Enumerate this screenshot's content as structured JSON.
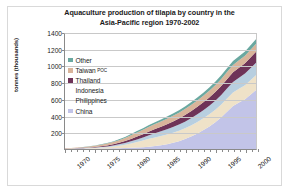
{
  "chart": {
    "title": "Aquaculture production of tilapia by country in the Asia-Pacific region 1970-2002",
    "title_line1": "Aquaculture production of tilapia by country in the",
    "title_line2": "Asia-Pacific region 1970-2002",
    "ylabel": "tonnes (thousands)"
  },
  "legend": {
    "items": [
      {
        "label": "Other",
        "sublabel": "",
        "color": "#6aa8a0"
      },
      {
        "label": "Taiwan",
        "sublabel": "POC",
        "color": "#d9b49a"
      },
      {
        "label": "Thailand",
        "sublabel": "",
        "color": "#6e3358"
      },
      {
        "label": "Indonesia",
        "sublabel": "",
        "color": "#b8cfe0"
      },
      {
        "label": "Philippines",
        "sublabel": "",
        "color": "#efe2c8"
      },
      {
        "label": "China",
        "sublabel": "",
        "color": "#c2c4e8"
      }
    ]
  },
  "axes": {
    "y_ticks": [
      "1400",
      "1200",
      "1000",
      "800",
      "600",
      "400",
      "200"
    ],
    "x_ticks": [
      "1970",
      "1975",
      "1980",
      "1985",
      "1990",
      "1995",
      "2000"
    ]
  },
  "chart_data": {
    "type": "area",
    "stacked": true,
    "title": "Aquaculture production of tilapia by country in the Asia-Pacific region 1970-2002",
    "xlabel": "",
    "ylabel": "tonnes (thousands)",
    "ylim": [
      0,
      1400
    ],
    "xlim": [
      1970,
      2002
    ],
    "grid": true,
    "legend_position": "inside-upper-left",
    "x": [
      1970,
      1971,
      1972,
      1973,
      1974,
      1975,
      1976,
      1977,
      1978,
      1979,
      1980,
      1981,
      1982,
      1983,
      1984,
      1985,
      1986,
      1987,
      1988,
      1989,
      1990,
      1991,
      1992,
      1993,
      1994,
      1995,
      1996,
      1997,
      1998,
      1999,
      2000,
      2001,
      2002
    ],
    "series": [
      {
        "name": "China",
        "color": "#c2c4e8",
        "values": [
          1,
          1,
          2,
          2,
          3,
          4,
          5,
          6,
          8,
          10,
          12,
          15,
          18,
          22,
          28,
          35,
          45,
          58,
          75,
          95,
          120,
          150,
          185,
          225,
          270,
          320,
          380,
          450,
          520,
          560,
          600,
          660,
          720
        ]
      },
      {
        "name": "Philippines",
        "color": "#efe2c8",
        "values": [
          2,
          3,
          4,
          5,
          7,
          9,
          12,
          16,
          22,
          30,
          40,
          52,
          66,
          80,
          95,
          105,
          112,
          118,
          122,
          126,
          130,
          134,
          138,
          142,
          146,
          150,
          154,
          158,
          162,
          166,
          170,
          176,
          182
        ]
      },
      {
        "name": "Indonesia",
        "color": "#b8cfe0",
        "values": [
          1,
          1,
          2,
          3,
          4,
          5,
          7,
          9,
          12,
          16,
          20,
          26,
          32,
          38,
          44,
          50,
          56,
          62,
          68,
          74,
          80,
          86,
          92,
          98,
          104,
          110,
          116,
          122,
          128,
          134,
          140,
          146,
          152
        ]
      },
      {
        "name": "Thailand",
        "color": "#6e3358",
        "values": [
          1,
          2,
          3,
          4,
          5,
          7,
          9,
          12,
          15,
          19,
          24,
          29,
          34,
          39,
          44,
          50,
          56,
          62,
          68,
          74,
          80,
          86,
          92,
          96,
          100,
          104,
          108,
          112,
          116,
          120,
          124,
          128,
          132
        ]
      },
      {
        "name": "Taiwan POC",
        "color": "#d9b49a",
        "values": [
          3,
          4,
          6,
          8,
          11,
          14,
          18,
          22,
          27,
          32,
          38,
          44,
          50,
          54,
          58,
          62,
          64,
          66,
          68,
          70,
          72,
          74,
          76,
          78,
          80,
          82,
          84,
          86,
          88,
          90,
          92,
          94,
          96
        ]
      },
      {
        "name": "Other",
        "color": "#6aa8a0",
        "values": [
          1,
          1,
          2,
          2,
          3,
          4,
          5,
          6,
          8,
          10,
          12,
          14,
          16,
          18,
          20,
          22,
          24,
          26,
          28,
          30,
          32,
          34,
          36,
          38,
          40,
          42,
          44,
          46,
          48,
          50,
          52,
          55,
          58
        ]
      }
    ],
    "totals": [
      9,
      12,
      19,
      24,
      33,
      43,
      56,
      71,
      92,
      117,
      146,
      180,
      216,
      251,
      289,
      322,
      357,
      392,
      429,
      469,
      514,
      564,
      619,
      677,
      740,
      808,
      886,
      974,
      1062,
      1120,
      1178,
      1259,
      1340
    ]
  }
}
